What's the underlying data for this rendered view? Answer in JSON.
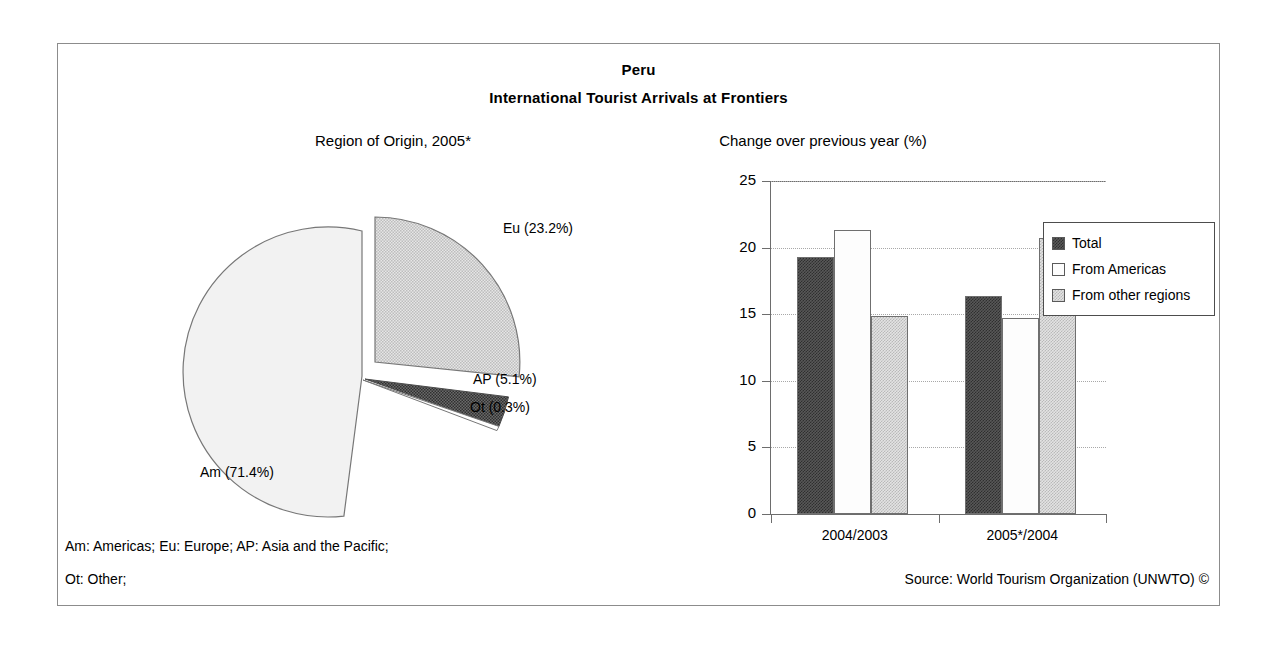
{
  "header": {
    "title": "Peru",
    "subtitle": "International Tourist Arrivals at Frontiers"
  },
  "pie_panel": {
    "subtitle": "Region of Origin, 2005*"
  },
  "bar_panel": {
    "subtitle": "Change over previous year (%)"
  },
  "footer": {
    "note_line1": "Am: Americas; Eu: Europe; AP: Asia and the Pacific;",
    "note_line2": "Ot: Other;",
    "source": "Source: World Tourism Organization (UNWTO) ©"
  },
  "labels": {
    "eu": "Eu (23.2%)",
    "ap": "AP (5.1%)",
    "ot": "Ot (0.3%)",
    "am": "Am (71.4%)"
  },
  "colors": {
    "total": "#585858",
    "from_americas": "#fdfdfd",
    "from_other_regions": "#e3e3e3",
    "slice_eu": "#d9d9d9",
    "slice_ap": "#4a4a4a",
    "slice_ot": "#ffffff",
    "slice_am": "#f2f2f2",
    "frame": "#8c8c8c",
    "axis": "#6d6d6d",
    "gridline": "#a8a8a8"
  },
  "chart_data": [
    {
      "type": "pie",
      "title": "Region of Origin, 2005*",
      "labels": [
        "Eu",
        "Am",
        "AP",
        "Ot"
      ],
      "label_texts": [
        "Eu (23.2%)",
        "Am (71.4%)",
        "AP (5.1%)",
        "Ot (0.3%)"
      ],
      "values": [
        23.2,
        71.4,
        5.1,
        0.3
      ],
      "unit": "%",
      "exploded": [
        "Eu"
      ],
      "legend": "none",
      "notes": "Am: Americas; Eu: Europe; AP: Asia and the Pacific; Ot: Other;"
    },
    {
      "type": "bar",
      "title": "Change over previous year (%)",
      "categories": [
        "2004/2003",
        "2005*/2004"
      ],
      "series": [
        {
          "name": "Total",
          "values": [
            19.3,
            16.4
          ]
        },
        {
          "name": "From Americas",
          "values": [
            21.3,
            14.7
          ]
        },
        {
          "name": "From other regions",
          "values": [
            14.9,
            20.7
          ]
        }
      ],
      "xlabel": "",
      "ylabel": "",
      "ylim": [
        0,
        25
      ],
      "yticks": [
        0,
        5,
        10,
        15,
        20,
        25
      ],
      "ytick_labels": [
        "0",
        "5",
        "10",
        "15",
        "20",
        "25"
      ],
      "grid": "horizontal-dotted",
      "legend_position": "top-right"
    }
  ]
}
